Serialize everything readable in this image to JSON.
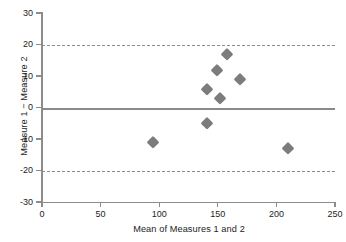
{
  "chart_data": {
    "type": "scatter",
    "title": "",
    "xlabel": "Mean of Measures 1 and 2",
    "ylabel": "Measure 1 − Measure 2",
    "xlim": [
      0,
      250
    ],
    "ylim": [
      -30,
      30
    ],
    "xticks": [
      0,
      50,
      100,
      150,
      200,
      250
    ],
    "yticks": [
      30,
      20,
      10,
      0,
      -10,
      -20,
      -30
    ],
    "xticklabels": [
      "0",
      "50",
      "100",
      "150",
      "200",
      "250"
    ],
    "yticklabels": [
      "30",
      "20",
      "10",
      "0",
      "-10",
      "-20",
      "-30"
    ],
    "grid": false,
    "legend": null,
    "marker": "diamond",
    "marker_color": "#7c7c7c",
    "line_color": "#8a8a8a",
    "points": [
      {
        "x": 95,
        "y": -11
      },
      {
        "x": 141,
        "y": 6
      },
      {
        "x": 141,
        "y": -5
      },
      {
        "x": 149,
        "y": 12
      },
      {
        "x": 152,
        "y": 3
      },
      {
        "x": 158,
        "y": 17
      },
      {
        "x": 169,
        "y": 9
      },
      {
        "x": 210,
        "y": -13
      }
    ],
    "reference_lines": [
      {
        "name": "upper-limit-of-agreement",
        "value": 20,
        "style": "dashed"
      },
      {
        "name": "bias",
        "value": 0,
        "style": "solid"
      },
      {
        "name": "lower-limit-of-agreement",
        "value": -20,
        "style": "dashed"
      }
    ]
  }
}
